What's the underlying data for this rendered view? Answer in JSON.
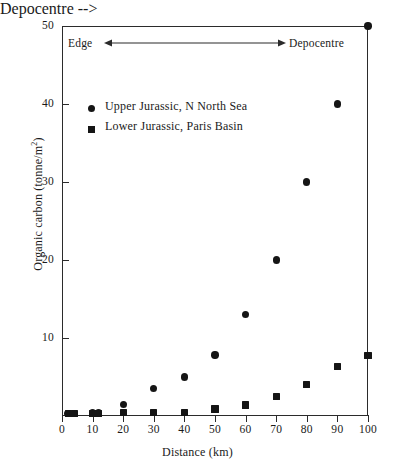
{
  "chart_data": {
    "type": "scatter",
    "title": "",
    "xlabel": "Distance (km)",
    "ylabel": "Organic carbon (tonne/m",
    "ylabel_sup": "2",
    "ylabel_suffix": ")",
    "xlim": [
      0,
      100
    ],
    "ylim": [
      0,
      50
    ],
    "xticks": [
      0,
      10,
      20,
      30,
      40,
      50,
      60,
      70,
      80,
      90,
      100
    ],
    "xtick_labels": [
      "0",
      "10",
      "20",
      "30",
      "40",
      "50",
      "60",
      "70",
      "80",
      "90",
      "100"
    ],
    "yticks": [
      10,
      20,
      30,
      40,
      50
    ],
    "ytick_labels": [
      "10",
      "20",
      "30",
      "40",
      "50"
    ],
    "grid": false,
    "legend_position": "upper left inside",
    "series": [
      {
        "name": "Upper Jurassic, N North Sea",
        "marker": "circle",
        "color": "#151515",
        "x": [
          2,
          4,
          10,
          12,
          20,
          30,
          40,
          50,
          60,
          70,
          80,
          90,
          100
        ],
        "y": [
          0.3,
          0.3,
          0.4,
          0.4,
          1.5,
          3.5,
          5.0,
          7.8,
          13.0,
          20.0,
          30.0,
          40.0,
          50.0
        ]
      },
      {
        "name": "Lower Jurassic, Paris Basin",
        "marker": "square",
        "color": "#151515",
        "x": [
          2,
          4,
          10,
          12,
          20,
          30,
          40,
          50,
          60,
          70,
          80,
          90,
          100
        ],
        "y": [
          0.3,
          0.3,
          0.3,
          0.3,
          0.4,
          0.4,
          0.4,
          0.9,
          1.4,
          2.5,
          4.0,
          6.3,
          7.8
        ]
      }
    ],
    "annotations": [
      {
        "name": "direction-arrow",
        "left_label": "Edge",
        "right_label": "Depocentre",
        "style": "double-headed-arrow",
        "y_value": 44
      }
    ]
  },
  "legend": {
    "items": [
      {
        "label": "Upper Jurassic, N North Sea",
        "marker": "circle"
      },
      {
        "label": "Lower Jurassic, Paris Basin",
        "marker": "square"
      }
    ]
  },
  "colors": {
    "marker": "#151515",
    "axis": "#2b2b2b",
    "background": "#ffffff"
  }
}
